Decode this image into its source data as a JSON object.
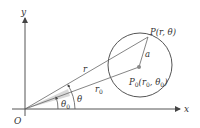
{
  "diagram": {
    "labels": {
      "y_axis": "y",
      "x_axis": "x",
      "origin": "O",
      "point_p": "P(r, θ)",
      "point_p0_main": "P",
      "point_p0_sub": "0",
      "point_p0_args": "(r",
      "point_p0_args_sub1": "0",
      "point_p0_args_mid": ", θ",
      "point_p0_args_sub2": "0",
      "point_p0_close": ")",
      "radius_a": "a",
      "segment_r": "r",
      "segment_r0_main": "r",
      "segment_r0_sub": "0",
      "angle_theta": "θ",
      "angle_theta0_main": "θ",
      "angle_theta0_sub": "0"
    },
    "colors": {
      "stroke": "#555555",
      "text": "#333333",
      "shade": "#d8d8d8"
    }
  }
}
